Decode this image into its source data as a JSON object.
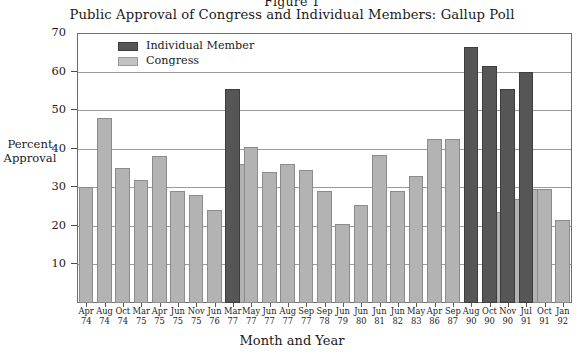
{
  "figure": {
    "number": "Figure 1",
    "title": "Public Approval of Congress and Individual Members: Gallup Poll"
  },
  "axes": {
    "ylabel_line1": "Percent",
    "ylabel_line2": "Approval",
    "xlabel": "Month and Year"
  },
  "legend": {
    "member_label": "Individual Member",
    "congress_label": "Congress"
  },
  "colors": {
    "member": "#565656",
    "congress": "#b3b3b3",
    "frame": "#6e6e6e",
    "grid": "#9a9a9a",
    "text": "#1a1a1a"
  },
  "chart_data": {
    "type": "bar",
    "title": "Public Approval of Congress and Individual Members: Gallup Poll",
    "xlabel": "Month and Year",
    "ylabel": "Percent Approval",
    "ylim": [
      0,
      70
    ],
    "yticks": [
      10,
      20,
      30,
      40,
      50,
      60,
      70
    ],
    "grid": true,
    "legend_position": "top-left-inside",
    "categories": [
      "Apr 74",
      "Aug 74",
      "Oct 74",
      "Mar 75",
      "Apr 75",
      "Jun 75",
      "Nov 75",
      "Jun 76",
      "Mar 77",
      "May 77",
      "Jun 77",
      "Aug 77",
      "Sep 77",
      "Sep 78",
      "Jun 79",
      "Jun 80",
      "Jun 81",
      "Jun 82",
      "May 83",
      "Apr 86",
      "Sep 87",
      "Aug 90",
      "Oct 90",
      "Nov 90",
      "Jul 91",
      "Oct 91",
      "Jan 92"
    ],
    "category_lines": [
      [
        "Apr",
        "74"
      ],
      [
        "Aug",
        "74"
      ],
      [
        "Oct",
        "74"
      ],
      [
        "Mar",
        "75"
      ],
      [
        "Apr",
        "75"
      ],
      [
        "Jun",
        "75"
      ],
      [
        "Nov",
        "75"
      ],
      [
        "Jun",
        "76"
      ],
      [
        "Mar",
        "77"
      ],
      [
        "May",
        "77"
      ],
      [
        "Jun",
        "77"
      ],
      [
        "Aug",
        "77"
      ],
      [
        "Sep",
        "77"
      ],
      [
        "Sep",
        "78"
      ],
      [
        "Jun",
        "79"
      ],
      [
        "Jun",
        "80"
      ],
      [
        "Jun",
        "81"
      ],
      [
        "Jun",
        "82"
      ],
      [
        "May",
        "83"
      ],
      [
        "Apr",
        "86"
      ],
      [
        "Sep",
        "87"
      ],
      [
        "Aug",
        "90"
      ],
      [
        "Oct",
        "90"
      ],
      [
        "Nov",
        "90"
      ],
      [
        "Jul",
        "91"
      ],
      [
        "Oct",
        "91"
      ],
      [
        "Jan",
        "92"
      ]
    ],
    "series": [
      {
        "name": "Congress",
        "color": "#b3b3b3",
        "values": [
          30,
          48,
          35,
          32,
          38,
          29,
          28,
          24,
          36,
          40.5,
          34,
          36,
          34.5,
          29,
          20.5,
          25.5,
          38.5,
          29,
          33,
          42.5,
          42.5,
          null,
          23.5,
          27,
          29.5,
          29.5,
          21.5
        ]
      },
      {
        "name": "Individual Member",
        "color": "#565656",
        "values": [
          null,
          null,
          null,
          null,
          null,
          null,
          null,
          null,
          55.5,
          null,
          null,
          null,
          null,
          null,
          null,
          null,
          null,
          null,
          null,
          null,
          null,
          66.5,
          61.5,
          55.5,
          60,
          null,
          null
        ]
      }
    ]
  }
}
